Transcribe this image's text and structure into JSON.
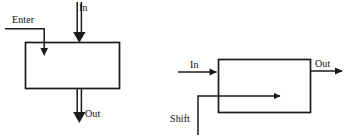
{
  "figure": {
    "background_color": "#ffffff",
    "stroke_color": "#1a1a1a",
    "diagrams": [
      {
        "id": "left-diagram",
        "name": "enter-in-out-block",
        "box": {
          "x": 25,
          "y": 42,
          "width": 95,
          "height": 47
        },
        "labels": {
          "enter": "Enter",
          "in": "In",
          "out": "Out"
        },
        "signals": [
          {
            "name": "enter",
            "label": "Enter",
            "style": "single-line",
            "direction": "down-into-box-top-left"
          },
          {
            "name": "in",
            "label": "In",
            "style": "double-line",
            "direction": "down-into-box-top"
          },
          {
            "name": "out",
            "label": "Out",
            "style": "double-line",
            "direction": "down-out-of-box-bottom"
          }
        ]
      },
      {
        "id": "right-diagram",
        "name": "in-out-shift-block",
        "box": {
          "x": 218,
          "y": 59,
          "width": 93,
          "height": 54
        },
        "labels": {
          "in": "In",
          "out": "Out",
          "shift": "Shift"
        },
        "signals": [
          {
            "name": "in",
            "label": "In",
            "style": "single-line",
            "direction": "right-into-box-left"
          },
          {
            "name": "out",
            "label": "Out",
            "style": "single-line",
            "direction": "right-out-of-box-right"
          },
          {
            "name": "shift",
            "label": "Shift",
            "style": "single-line",
            "direction": "up-then-right-into-box"
          }
        ]
      }
    ]
  }
}
